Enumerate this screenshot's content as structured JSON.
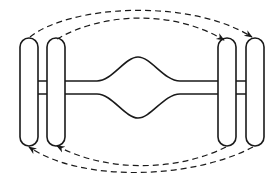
{
  "diagram": {
    "type": "tire-rotation",
    "description": "Dual-wheel axle tire rotation, cross pattern",
    "colors": {
      "stroke": "#1a1a1a",
      "background": "#ffffff"
    },
    "tires": [
      {
        "id": "left-outer",
        "x": 20,
        "y": 38,
        "w": 18,
        "h": 108
      },
      {
        "id": "left-inner",
        "x": 47,
        "y": 38,
        "w": 18,
        "h": 108
      },
      {
        "id": "right-inner",
        "x": 218,
        "y": 38,
        "w": 18,
        "h": 108
      },
      {
        "id": "right-outer",
        "x": 246,
        "y": 38,
        "w": 18,
        "h": 108
      }
    ],
    "arrows": [
      {
        "from": "left-outer",
        "to": "right-outer",
        "path": "M 30 37 C 70 5, 190 -2, 250 38",
        "position": "top"
      },
      {
        "from": "left-inner",
        "to": "right-inner",
        "path": "M 57 40 C 100 14, 170 8, 222 41",
        "position": "top"
      },
      {
        "from": "right-outer",
        "to": "left-outer",
        "path": "M 252 147 C 190 178, 80 182, 30 146",
        "position": "bottom"
      },
      {
        "from": "right-inner",
        "to": "left-inner",
        "path": "M 226 146 C 180 170, 110 174, 58 145",
        "position": "bottom"
      }
    ]
  }
}
